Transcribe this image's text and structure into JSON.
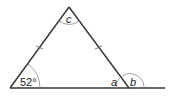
{
  "diagram": {
    "type": "isosceles-triangle-angles",
    "stroke_color": "#333333",
    "vertices": {
      "left": [
        10,
        88
      ],
      "apex": [
        69,
        7
      ],
      "right": [
        129,
        88
      ]
    },
    "baseline": {
      "x1": 10,
      "x2": 165,
      "y": 88
    },
    "labels": {
      "left_angle": "52°",
      "interior_right": "a",
      "exterior_right": "b",
      "apex_angle": "c"
    },
    "equal_sides_marked": [
      "left",
      "right"
    ]
  }
}
